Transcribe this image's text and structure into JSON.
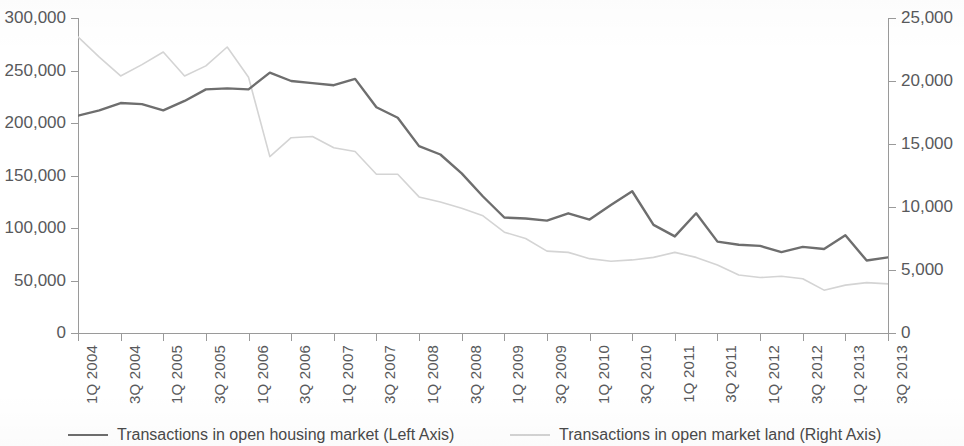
{
  "chart_data": {
    "type": "line",
    "title": "",
    "subtitle": "",
    "xlabel": "",
    "ylabel": "",
    "grid": false,
    "legend_position": "bottom",
    "x": [
      "1Q 2004",
      "2Q 2004",
      "3Q 2004",
      "4Q 2004",
      "1Q 2005",
      "2Q 2005",
      "3Q 2005",
      "4Q 2005",
      "1Q 2006",
      "2Q 2006",
      "3Q 2006",
      "4Q 2006",
      "1Q 2007",
      "2Q 2007",
      "3Q 2007",
      "4Q 2007",
      "1Q 2008",
      "2Q 2008",
      "3Q 2008",
      "4Q 2008",
      "1Q 2009",
      "2Q 2009",
      "3Q 2009",
      "4Q 2009",
      "1Q 2010",
      "2Q 2010",
      "3Q 2010",
      "4Q 2010",
      "1Q 2011",
      "2Q 2011",
      "3Q 2011",
      "4Q 2011",
      "1Q 2012",
      "2Q 2012",
      "3Q 2012",
      "4Q 2012",
      "1Q 2013",
      "2Q 2013",
      "3Q 2013"
    ],
    "x_tick_labels": [
      "1Q 2004",
      "3Q 2004",
      "1Q 2005",
      "3Q 2005",
      "1Q 2006",
      "3Q 2006",
      "1Q 2007",
      "3Q 2007",
      "1Q 2008",
      "3Q 2008",
      "1Q 2009",
      "3Q 2009",
      "1Q 2010",
      "3Q 2010",
      "1Q 2011",
      "3Q 2011",
      "1Q 2012",
      "3Q 2012",
      "1Q 2013",
      "3Q 2013"
    ],
    "left_axis": {
      "ylim": [
        0,
        300000
      ],
      "ticks": [
        0,
        50000,
        100000,
        150000,
        200000,
        250000,
        300000
      ],
      "tick_labels": [
        "0",
        "50,000",
        "100,000",
        "150,000",
        "200,000",
        "250,000",
        "300,000"
      ]
    },
    "right_axis": {
      "ylim": [
        0,
        25000
      ],
      "ticks": [
        0,
        5000,
        10000,
        15000,
        20000,
        25000
      ],
      "tick_labels": [
        "0",
        "5,000",
        "10,000",
        "15,000",
        "20,000",
        "25,000"
      ]
    },
    "series": [
      {
        "name": "Transactions in open housing market (Left Axis)",
        "axis": "left",
        "color": "#6e6e6e",
        "values": [
          207000,
          212000,
          219000,
          218000,
          212000,
          221000,
          232000,
          233000,
          232000,
          248000,
          240000,
          238000,
          236000,
          242000,
          215000,
          205000,
          178000,
          170000,
          152000,
          130000,
          110000,
          109000,
          107000,
          114000,
          108000,
          122000,
          135000,
          103000,
          92000,
          114000,
          87000,
          84000,
          83000,
          77000,
          82000,
          80000,
          93000,
          69000,
          72000
        ]
      },
      {
        "name": "Transactions in open market land (Right Axis)",
        "axis": "right",
        "color": "#d4d4d4",
        "values": [
          23500,
          21900,
          20400,
          21300,
          22300,
          20400,
          21200,
          22700,
          20300,
          14000,
          15500,
          15600,
          14700,
          14400,
          12600,
          12600,
          10800,
          10400,
          9900,
          9300,
          8000,
          7500,
          6500,
          6400,
          5900,
          5700,
          5800,
          6000,
          6400,
          6000,
          5400,
          4600,
          4400,
          4500,
          4300,
          3400,
          3800,
          4000,
          3900
        ]
      }
    ]
  },
  "legend": {
    "items": [
      {
        "label": "Transactions in open housing market (Left Axis)",
        "color": "#6e6e6e"
      },
      {
        "label": "Transactions in open market land (Right Axis)",
        "color": "#d4d4d4"
      }
    ]
  }
}
